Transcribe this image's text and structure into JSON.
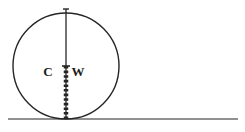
{
  "figure": {
    "background_color": "#ffffff",
    "stroke_color": "#262626",
    "ground_color": "#6b6b6b",
    "label_color": "#1c1c1c"
  },
  "circle": {
    "name": "wheel",
    "center_x": 66,
    "center_y": 66,
    "radius": 53,
    "stroke_width": 1.4,
    "fill": "none"
  },
  "ground": {
    "name": "ground-line",
    "x1": 8,
    "x2": 238,
    "y": 119,
    "stroke_width": 1.6
  },
  "vertical_axis": {
    "name": "vertical-diameter",
    "x": 66,
    "y_top": 9,
    "y_center": 66,
    "y_bottom": 119,
    "stroke_width": 1.3
  },
  "hatched_segment": {
    "name": "hatched-radius",
    "x": 66,
    "y_start": 66,
    "y_end": 119,
    "bar_width": 4.5,
    "dash_on": 2.6,
    "dash_off": 2.0
  },
  "center_tick": {
    "name": "center-tick-mark",
    "x": 66,
    "y": 66,
    "half_width": 4,
    "stroke_width": 1.6
  },
  "top_tick": {
    "name": "top-tick-mark",
    "x": 66,
    "y": 9,
    "half_width": 3,
    "stroke_width": 1.4
  },
  "labels": [
    {
      "id": "label-c",
      "text": "C",
      "x": 48,
      "y": 76
    },
    {
      "id": "label-w",
      "text": "W",
      "x": 78,
      "y": 76
    }
  ]
}
